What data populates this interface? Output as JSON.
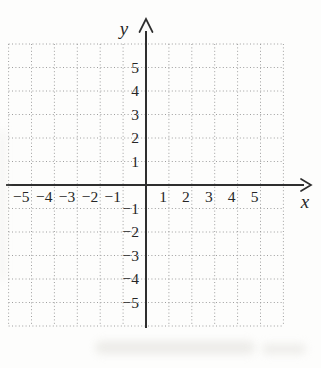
{
  "chart_data": {
    "type": "scatter",
    "title": "",
    "subtitle": "",
    "xlabel": "x",
    "ylabel": "y",
    "xlim": [
      -6,
      6
    ],
    "ylim": [
      -6,
      6
    ],
    "grid": "dotted",
    "legend": "none",
    "series": [],
    "x_ticks": [
      {
        "value": -5,
        "label": "−5"
      },
      {
        "value": -4,
        "label": "−4"
      },
      {
        "value": -3,
        "label": "−3"
      },
      {
        "value": -2,
        "label": "−2"
      },
      {
        "value": -1,
        "label": "−1"
      },
      {
        "value": 1,
        "label": "1"
      },
      {
        "value": 2,
        "label": "2"
      },
      {
        "value": 3,
        "label": "3"
      },
      {
        "value": 4,
        "label": "4"
      },
      {
        "value": 5,
        "label": "5"
      }
    ],
    "y_ticks": [
      {
        "value": 5,
        "label": "5"
      },
      {
        "value": 4,
        "label": "4"
      },
      {
        "value": 3,
        "label": "3"
      },
      {
        "value": 2,
        "label": "2"
      },
      {
        "value": 1,
        "label": "1"
      },
      {
        "value": -1,
        "label": "−1"
      },
      {
        "value": -2,
        "label": "−2"
      },
      {
        "value": -3,
        "label": "−3"
      },
      {
        "value": -4,
        "label": "−4"
      },
      {
        "value": -5,
        "label": "−5"
      }
    ]
  },
  "colors": {
    "background": "#fdfdfc",
    "grid_dots": "#9e9e9e",
    "axis": "#2e2e2e",
    "tick_text": "#262626",
    "show_through": "#e7e6e2"
  }
}
